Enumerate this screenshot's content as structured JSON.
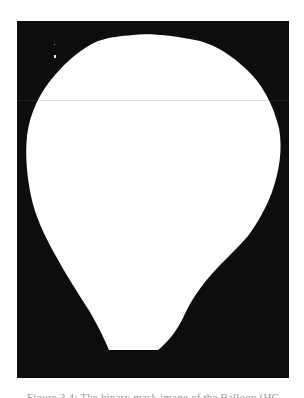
{
  "figure": {
    "type": "binary-mask-image",
    "colors": {
      "background": "#ffffff",
      "mask_background": "#0d0d0d",
      "mask_foreground": "#ffffff",
      "scanline": "#6a6a6a",
      "caption": "#9a9a9a"
    },
    "caption": "Figure 3.4: The binary mask image of the Balloon (HC"
  }
}
